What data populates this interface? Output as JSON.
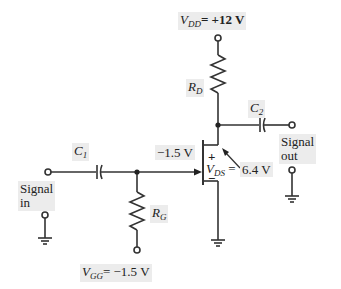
{
  "diagram": {
    "type": "JFET common-source amplifier circuit",
    "supply": {
      "label": "V",
      "subscript": "DD",
      "value": "= +12 V"
    },
    "gate_supply": {
      "label": "V",
      "subscript": "GG",
      "value": "= −1.5 V"
    },
    "components": {
      "rd": {
        "label": "R",
        "subscript": "D"
      },
      "rg": {
        "label": "R",
        "subscript": "G"
      },
      "c1": {
        "label": "C",
        "subscript": "1"
      },
      "c2": {
        "label": "C",
        "subscript": "2"
      }
    },
    "gate_voltage": "−1.5 V",
    "vds": {
      "plus": "+",
      "minus": "−",
      "label": "V",
      "subscript": "DS",
      "eq": "=",
      "value": "6.4 V"
    },
    "signal_in": {
      "line1": "Signal",
      "line2": "in"
    },
    "signal_out": {
      "line1": "Signal",
      "line2": "out"
    },
    "colors": {
      "wire": "#333333",
      "label_bg": "#ececec"
    }
  }
}
